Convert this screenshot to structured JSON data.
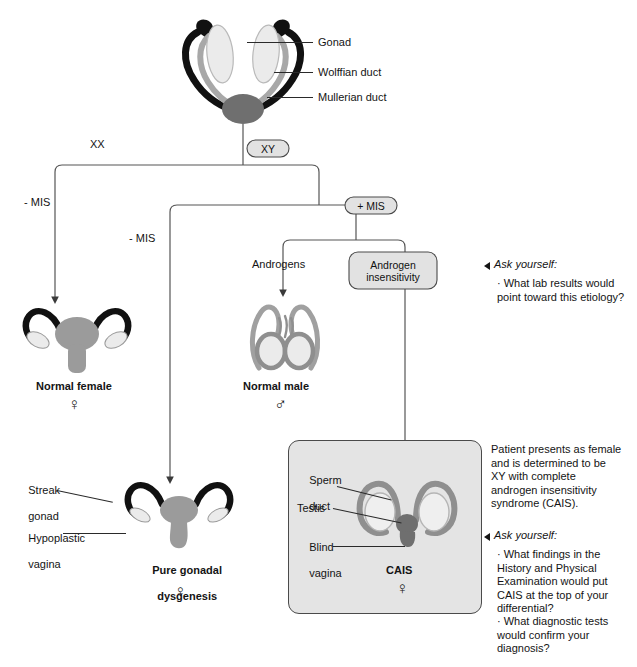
{
  "diagram": {
    "top_labels": [
      {
        "id": "gonad",
        "text": "Gonad"
      },
      {
        "id": "wolffian-duct",
        "text": "Wolffian duct"
      },
      {
        "id": "mullerian-duct",
        "text": "Mullerian duct"
      }
    ],
    "branch_labels": [
      {
        "id": "xx",
        "text": "XX"
      },
      {
        "id": "mis-negative-left",
        "text": "- MIS"
      },
      {
        "id": "mis-negative-mid",
        "text": "- MIS"
      },
      {
        "id": "androgens",
        "text": "Androgens"
      }
    ],
    "pills": [
      {
        "id": "xy",
        "text": "XY"
      },
      {
        "id": "plus-mis",
        "text": "+ MIS"
      }
    ],
    "boxes": [
      {
        "id": "androgen-insensitivity",
        "line1": "Androgen",
        "line2": "insensitivity"
      }
    ],
    "outcomes": [
      {
        "id": "normal-female",
        "label": "Normal female",
        "symbol": "♀"
      },
      {
        "id": "normal-male",
        "label": "Normal male",
        "symbol": "♂"
      },
      {
        "id": "pure-gonadal-dysgenesis",
        "label_line1": "Pure gonadal",
        "label_line2": "dysgenesis",
        "symbol": "♀"
      },
      {
        "id": "cais",
        "label": "CAIS",
        "symbol": "♀"
      }
    ],
    "dysgenesis_labels": [
      {
        "id": "streak-gonad",
        "line1": "Streak",
        "line2": "gonad"
      },
      {
        "id": "hypoplastic-vagina",
        "line1": "Hypoplastic",
        "line2": "vagina"
      }
    ],
    "cais_labels": [
      {
        "id": "sperm-duct",
        "line1": "Sperm",
        "line2": "duct"
      },
      {
        "id": "testis",
        "line1": "Testis",
        "line2": ""
      },
      {
        "id": "blind-vagina",
        "line1": "Blind",
        "line2": "vagina"
      }
    ]
  },
  "side_notes": {
    "ask_yourself_label": "Ask yourself:",
    "first_block": {
      "bullets": [
        "· What lab results would\n  point toward this etiology?"
      ]
    },
    "case_paragraph": "Patient presents as female\nand is determined to be\nXY with complete\nandrogen insensitivity\nsyndrome (CAIS).",
    "second_block": {
      "bullets": [
        "· What findings in the\n  History and Physical\n  Examination would put\n  CAIS at the top of your\n  differential?",
        "· What diagnostic tests\n  would confirm your\n  diagnosis?"
      ]
    }
  },
  "colors": {
    "mullerian_black": "#111111",
    "wolffian_gray": "#a8a8a8",
    "gonad_light": "#e8e8e8",
    "uterus_gray": "#9b9b9b",
    "box_fill": "#e2e2e2",
    "cais_panel": "#e4e4e4",
    "line": "#555555",
    "text": "#141414"
  }
}
